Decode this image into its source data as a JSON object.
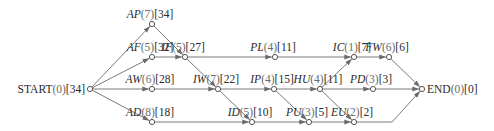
{
  "diagram": {
    "type": "activity-network",
    "nodes": [
      {
        "id": "START",
        "label": "START",
        "duration": "(0)",
        "slack": "[34]",
        "x": 90,
        "y": 89,
        "italic": false,
        "label_pos": "left"
      },
      {
        "id": "AP",
        "label": "AP",
        "duration": "(7)",
        "slack": "[34]",
        "x": 152,
        "y": 24,
        "italic": true,
        "label_pos": "above"
      },
      {
        "id": "AF",
        "label": "AF",
        "duration": "(5)",
        "slack": "[32]",
        "x": 152,
        "y": 57,
        "italic": true,
        "label_pos": "above"
      },
      {
        "id": "AW",
        "label": "AW",
        "duration": "(6)",
        "slack": "[28]",
        "x": 152,
        "y": 89,
        "italic": true,
        "label_pos": "above"
      },
      {
        "id": "AD",
        "label": "AD",
        "duration": "(8)",
        "slack": "[18]",
        "x": 152,
        "y": 122,
        "italic": true,
        "label_pos": "above"
      },
      {
        "id": "IF",
        "label": "IF",
        "duration": "(5)",
        "slack": "[27]",
        "x": 185,
        "y": 57,
        "italic": true,
        "label_pos": "above"
      },
      {
        "id": "IW",
        "label": "IW",
        "duration": "(7)",
        "slack": "[22]",
        "x": 218,
        "y": 89,
        "italic": true,
        "label_pos": "above"
      },
      {
        "id": "ID",
        "label": "ID",
        "duration": "(5)",
        "slack": "[10]",
        "x": 252,
        "y": 122,
        "italic": true,
        "label_pos": "above"
      },
      {
        "id": "PL",
        "label": "PL",
        "duration": "(4)",
        "slack": "[11]",
        "x": 275,
        "y": 57,
        "italic": true,
        "label_pos": "above"
      },
      {
        "id": "IP",
        "label": "IP",
        "duration": "(4)",
        "slack": "[15]",
        "x": 274,
        "y": 89,
        "italic": true,
        "label_pos": "above"
      },
      {
        "id": "PU",
        "label": "PU",
        "duration": "(3)",
        "slack": "[5]",
        "x": 309,
        "y": 122,
        "italic": true,
        "label_pos": "above"
      },
      {
        "id": "HU",
        "label": "HU",
        "duration": "(4)",
        "slack": "[11]",
        "x": 320,
        "y": 89,
        "italic": true,
        "label_pos": "above"
      },
      {
        "id": "IC",
        "label": "IC",
        "duration": "(1)",
        "slack": "[7]",
        "x": 354,
        "y": 57,
        "italic": true,
        "label_pos": "above"
      },
      {
        "id": "EU",
        "label": "EU",
        "duration": "(2)",
        "slack": "[2]",
        "x": 354,
        "y": 122,
        "italic": true,
        "label_pos": "above"
      },
      {
        "id": "PD",
        "label": "PD",
        "duration": "(3)",
        "slack": "[3]",
        "x": 373,
        "y": 89,
        "italic": true,
        "label_pos": "above"
      },
      {
        "id": "FW",
        "label": "FW",
        "duration": "(6)",
        "slack": "[6]",
        "x": 389,
        "y": 57,
        "italic": true,
        "label_pos": "above"
      },
      {
        "id": "END",
        "label": "END",
        "duration": "(0)",
        "slack": "[0]",
        "x": 422,
        "y": 89,
        "italic": false,
        "label_pos": "right"
      }
    ],
    "edges": [
      {
        "from": "START",
        "to": "AP"
      },
      {
        "from": "START",
        "to": "AF"
      },
      {
        "from": "START",
        "to": "AW"
      },
      {
        "from": "START",
        "to": "AD"
      },
      {
        "from": "AP",
        "to": "IF"
      },
      {
        "from": "AF",
        "to": "IF"
      },
      {
        "from": "IF",
        "to": "PL"
      },
      {
        "from": "IF",
        "to": "IW"
      },
      {
        "from": "AW",
        "to": "IW"
      },
      {
        "from": "AD",
        "to": "ID"
      },
      {
        "from": "IW",
        "to": "IP"
      },
      {
        "from": "IW",
        "to": "ID"
      },
      {
        "from": "PL",
        "to": "IC"
      },
      {
        "from": "IP",
        "to": "HU"
      },
      {
        "from": "IP",
        "to": "PU"
      },
      {
        "from": "ID",
        "to": "PU"
      },
      {
        "from": "HU",
        "to": "IC"
      },
      {
        "from": "HU",
        "to": "PD"
      },
      {
        "from": "HU",
        "to": "EU"
      },
      {
        "from": "PU",
        "to": "EU"
      },
      {
        "from": "IC",
        "to": "FW"
      },
      {
        "from": "FW",
        "to": "END"
      },
      {
        "from": "PD",
        "to": "END"
      },
      {
        "from": "EU",
        "to": "END",
        "via": [
          [
            392,
            122
          ]
        ]
      }
    ],
    "colors": {
      "edge": "#7a7a7a",
      "node_stroke": "#555555",
      "text": "#2a2a2a",
      "duration_text": "#6a6a6a"
    }
  }
}
